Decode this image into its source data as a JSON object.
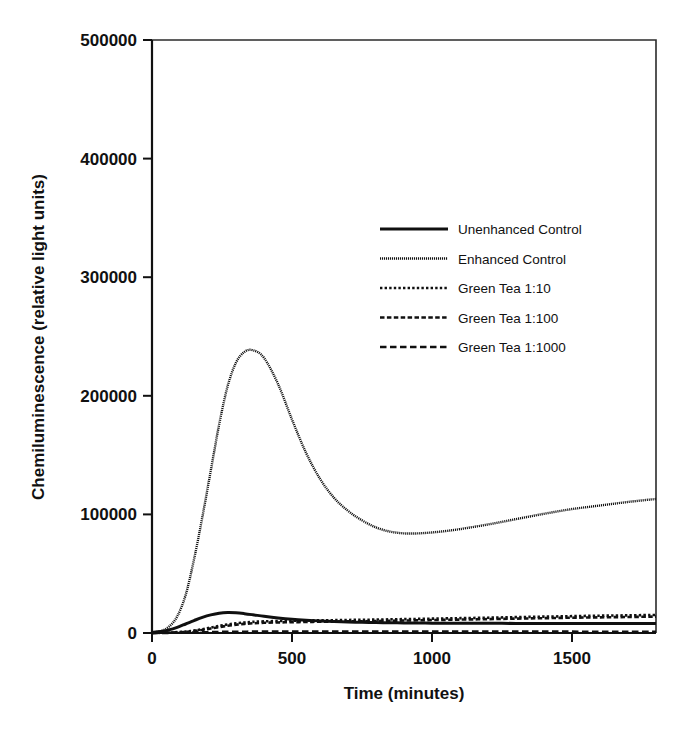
{
  "chart_data": {
    "type": "line",
    "title": "",
    "xlabel": "Time (minutes)",
    "ylabel": "Chemiluminescence (relative light units)",
    "xlim": [
      0,
      1800
    ],
    "ylim": [
      0,
      500000
    ],
    "xticks": [
      0,
      500,
      1000,
      1500
    ],
    "xtick_labels": [
      "0",
      "500",
      "1000",
      "1500"
    ],
    "yticks": [
      0,
      100000,
      200000,
      300000,
      400000,
      500000
    ],
    "ytick_labels": [
      "0",
      "100000",
      "200000",
      "300000",
      "400000",
      "500000"
    ],
    "grid": false,
    "legend_position": "upper center-right",
    "x": [
      0,
      30,
      60,
      90,
      120,
      150,
      180,
      210,
      240,
      270,
      300,
      330,
      360,
      400,
      450,
      500,
      550,
      600,
      650,
      700,
      750,
      800,
      850,
      900,
      950,
      1000,
      1050,
      1100,
      1200,
      1300,
      1400,
      1500,
      1600,
      1700,
      1800
    ],
    "series": [
      {
        "name": "Unenhanced Control",
        "style": "solid",
        "color": "#101010",
        "values": [
          500,
          1200,
          2600,
          4800,
          7600,
          10500,
          13200,
          15300,
          16700,
          17200,
          17000,
          16300,
          15400,
          14100,
          12700,
          11600,
          10800,
          10200,
          9700,
          9300,
          9000,
          8800,
          8600,
          8500,
          8400,
          8300,
          8250,
          8200,
          8150,
          8100,
          8100,
          8050,
          8050,
          8000,
          8000
        ]
      },
      {
        "name": "Enhanced Control",
        "style": "fine-dotted",
        "color": "#303030",
        "values": [
          300,
          1500,
          5200,
          14000,
          32000,
          62000,
          98000,
          137000,
          176000,
          208000,
          228000,
          237000,
          238500,
          232000,
          210000,
          180000,
          152000,
          130000,
          114000,
          103000,
          95000,
          89000,
          85500,
          84000,
          84000,
          84800,
          86000,
          87600,
          91500,
          96000,
          100500,
          104500,
          107500,
          110500,
          113000
        ]
      },
      {
        "name": "Green Tea 1:10",
        "style": "dotted",
        "color": "#101010",
        "values": [
          100,
          200,
          400,
          700,
          1200,
          2000,
          3200,
          4600,
          6000,
          7200,
          8200,
          8900,
          9400,
          9800,
          10100,
          10300,
          10500,
          10700,
          10800,
          11000,
          11100,
          11300,
          11500,
          11700,
          11900,
          12100,
          12300,
          12500,
          12900,
          13400,
          13800,
          14200,
          14600,
          14900,
          15200
        ]
      },
      {
        "name": "Green Tea 1:100",
        "style": "dashed-small",
        "color": "#101010",
        "values": [
          80,
          150,
          300,
          550,
          950,
          1600,
          2600,
          3800,
          5000,
          6100,
          7000,
          7700,
          8200,
          8600,
          8900,
          9100,
          9300,
          9500,
          9600,
          9800,
          9900,
          10100,
          10300,
          10500,
          10700,
          10900,
          11100,
          11300,
          11700,
          12100,
          12500,
          12900,
          13200,
          13500,
          13800
        ]
      },
      {
        "name": "Green Tea 1:1000",
        "style": "dashed-large",
        "color": "#101010",
        "values": [
          60,
          90,
          140,
          220,
          330,
          470,
          620,
          760,
          880,
          980,
          1050,
          1100,
          1140,
          1170,
          1190,
          1200,
          1210,
          1210,
          1210,
          1200,
          1200,
          1190,
          1190,
          1180,
          1180,
          1170,
          1170,
          1160,
          1150,
          1140,
          1130,
          1120,
          1110,
          1100,
          1090
        ]
      }
    ],
    "legend_entries": [
      {
        "label": "Unenhanced Control",
        "style": "solid"
      },
      {
        "label": "Enhanced Control",
        "style": "fine-dotted"
      },
      {
        "label": "Green Tea 1:10",
        "style": "dotted"
      },
      {
        "label": "Green Tea 1:100",
        "style": "dashed-small"
      },
      {
        "label": "Green Tea 1:1000",
        "style": "dashed-large"
      }
    ]
  },
  "axes": {
    "x_title": "Time (minutes)",
    "y_title": "Chemiluminescence (relative light units)"
  }
}
